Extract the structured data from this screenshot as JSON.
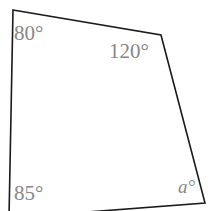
{
  "figure": {
    "type": "quadrilateral-angle-diagram",
    "background_color": "#ffffff",
    "stroke_color": "#1a1a1a",
    "stroke_width": 1.6,
    "label_color": "#878787",
    "vertices": [
      {
        "name": "top-left",
        "x": 13,
        "y": 10
      },
      {
        "name": "top-right",
        "x": 161,
        "y": 35
      },
      {
        "name": "bottom-right",
        "x": 205,
        "y": 203
      },
      {
        "name": "bottom-left",
        "x": 9,
        "y": 218
      }
    ],
    "path": "M 13 10 L 161 35 L 205 203 L 9 218 Z",
    "labels": [
      {
        "id": "top-left",
        "text": "80°",
        "style": "upright"
      },
      {
        "id": "top-right",
        "text": "120°",
        "style": "upright"
      },
      {
        "id": "bottom-left",
        "text": "85°",
        "style": "upright"
      },
      {
        "id": "unknown",
        "text": "a°",
        "style": "italic"
      }
    ],
    "angles": {
      "top_left": "80°",
      "top_right": "120°",
      "bottom_left": "85°",
      "bottom_right_unknown": "a°"
    }
  }
}
